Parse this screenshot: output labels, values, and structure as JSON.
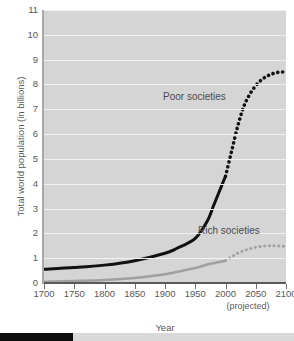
{
  "chart_data": {
    "type": "line",
    "title": "",
    "xlabel": "Year",
    "ylabel": "Total world population (in billions)",
    "xlim": [
      1700,
      2100
    ],
    "ylim": [
      0,
      11
    ],
    "grid": true,
    "legend_position": "inline-annotations",
    "xticks": [
      "1700",
      "1750",
      "1800",
      "1850",
      "1900",
      "1950",
      "2000",
      "2050",
      "2100"
    ],
    "yticks": [
      "0",
      "1",
      "2",
      "3",
      "4",
      "5",
      "6",
      "7",
      "8",
      "9",
      "10",
      "11"
    ],
    "annotations": [
      {
        "text": "Poor societies",
        "x": 1970,
        "y": 7.2
      },
      {
        "text": "Rich societies",
        "x": 2030,
        "y": 1.95
      },
      {
        "text": "(projected)",
        "x": 2075,
        "y": -1.1
      }
    ],
    "series": [
      {
        "name": "Poor societies",
        "color": "#111111",
        "style_historical": "solid",
        "style_projected": "dotted",
        "split_year": 2000,
        "x": [
          1700,
          1750,
          1800,
          1850,
          1900,
          1920,
          1950,
          1970,
          1980,
          1990,
          2000,
          2010,
          2020,
          2030,
          2040,
          2050,
          2060,
          2070,
          2080,
          2090,
          2100
        ],
        "values": [
          0.55,
          0.62,
          0.72,
          0.9,
          1.2,
          1.4,
          1.8,
          2.5,
          3.1,
          3.7,
          4.3,
          5.3,
          6.3,
          7.1,
          7.6,
          7.95,
          8.2,
          8.35,
          8.45,
          8.5,
          8.5
        ]
      },
      {
        "name": "Rich societies",
        "color": "#a0a0a0",
        "style_historical": "solid",
        "style_projected": "dotted",
        "split_year": 2000,
        "x": [
          1700,
          1750,
          1800,
          1850,
          1900,
          1920,
          1950,
          1970,
          1980,
          1990,
          2000,
          2010,
          2020,
          2030,
          2040,
          2050,
          2060,
          2070,
          2080,
          2090,
          2100
        ],
        "values": [
          0.05,
          0.08,
          0.12,
          0.2,
          0.35,
          0.45,
          0.6,
          0.75,
          0.8,
          0.85,
          0.9,
          1.05,
          1.2,
          1.3,
          1.38,
          1.44,
          1.48,
          1.5,
          1.5,
          1.49,
          1.47
        ]
      }
    ]
  },
  "axes": {
    "y_title": "Total world population (in billions)",
    "x_title": "Year",
    "projected_note": "(projected)",
    "y_labels": [
      "11",
      "10",
      "9",
      "8",
      "7",
      "6",
      "5",
      "4",
      "3",
      "2",
      "1",
      "0"
    ],
    "x_labels": [
      "1700",
      "1750",
      "1800",
      "1850",
      "1900",
      "1950",
      "2000",
      "2050",
      "2100"
    ]
  },
  "labels": {
    "poor": "Poor societies",
    "rich": "Rich societies"
  },
  "colors": {
    "plot_background": "#d5d5d5",
    "gridline": "#f2f2f2",
    "poor_series": "#111111",
    "rich_series": "#a0a0a0",
    "text": "#58585a",
    "bottom_bar": "#0c0c0c"
  }
}
